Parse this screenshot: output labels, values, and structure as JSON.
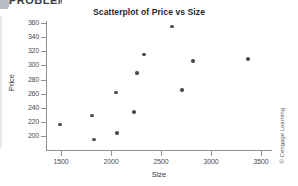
{
  "header": {
    "fragment_text": "PROBLEMS",
    "badge_icon": "circle-badge-icon"
  },
  "credit": "© Cengage Learning",
  "chart_data": {
    "type": "scatter",
    "title": "Scatterplot of Price vs Size",
    "xlabel": "Size",
    "ylabel": "Price",
    "xlim": [
      1300,
      3600
    ],
    "ylim": [
      190,
      365
    ],
    "xticks": [
      1500,
      2000,
      2500,
      3000,
      3500
    ],
    "yticks": [
      200,
      220,
      240,
      260,
      280,
      300,
      320,
      340,
      360
    ],
    "grid": false,
    "legend": null,
    "marker_color": "#4c5055",
    "axis_color": "#8c9094",
    "points": [
      {
        "x": 1490,
        "y": 216
      },
      {
        "x": 1810,
        "y": 229
      },
      {
        "x": 1830,
        "y": 195
      },
      {
        "x": 2050,
        "y": 262
      },
      {
        "x": 2060,
        "y": 204
      },
      {
        "x": 2230,
        "y": 234
      },
      {
        "x": 2260,
        "y": 289
      },
      {
        "x": 2330,
        "y": 315
      },
      {
        "x": 2610,
        "y": 355
      },
      {
        "x": 2710,
        "y": 265
      },
      {
        "x": 2820,
        "y": 306
      },
      {
        "x": 3370,
        "y": 309
      }
    ]
  }
}
